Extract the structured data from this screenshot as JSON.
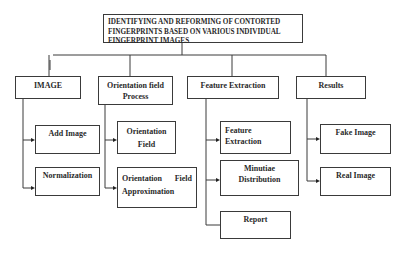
{
  "diagram": {
    "title": {
      "line1": "IDENTIFYING AND REFORMING OF CONTORTED",
      "line2": "FINGERPRINTS BASED ON VARIOUS INDIVIDUAL",
      "line3": "FINGERPRINT IMAGES"
    },
    "modules": [
      {
        "label": "IMAGE",
        "children": [
          "Add Image",
          "Normalization"
        ]
      },
      {
        "label_line1": "Orientation field",
        "label_line2": "Process",
        "children": [
          {
            "line1": "Orientation",
            "line2": "Field"
          },
          {
            "line1_left": "Orientation",
            "line1_right": "Field",
            "line2": "Approximation"
          }
        ]
      },
      {
        "label": "Feature Extraction",
        "children": [
          {
            "line1": "Feature",
            "line2": "Extraction"
          },
          {
            "line1": "Minutiae",
            "line2": "Distribution"
          },
          {
            "line1": "Report"
          }
        ]
      },
      {
        "label": "Results",
        "children": [
          "Fake Image",
          "Real Image"
        ]
      }
    ],
    "colors": {
      "line": "#3a3a3a",
      "text": "#2a2a2a",
      "background": "#ffffff"
    }
  }
}
